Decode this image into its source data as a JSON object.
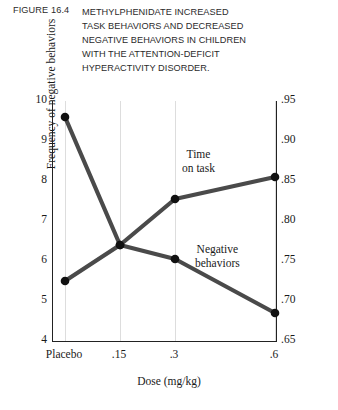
{
  "figure": {
    "number_label": "FIGURE 16.4",
    "title_lines": [
      "METHYLPHENIDATE INCREASED",
      "TASK BEHAVIORS AND DECREASED",
      "NEGATIVE BEHAVIORS IN CHILDREN",
      "WITH THE ATTENTION-DEFICIT",
      "HYPERACTIVITY DISORDER."
    ]
  },
  "chart_data": {
    "type": "line",
    "title": "METHYLPHENIDATE INCREASED TASK BEHAVIORS AND DECREASED NEGATIVE BEHAVIORS IN CHILDREN WITH THE ATTENTION-DEFICIT HYPERACTIVITY DISORDER.",
    "xlabel": "Dose (mg/kg)",
    "ylabel": "Frequency of negative behaviors",
    "ylabel_right": "Proportion on task",
    "categories": [
      "Placebo",
      ".15",
      ".3",
      ".6"
    ],
    "x_positions": [
      0,
      0.15,
      0.3,
      0.6
    ],
    "xticklabels": [
      "Placebo",
      ".15",
      ".3",
      ".6"
    ],
    "ylim": [
      4,
      10
    ],
    "yticks": [
      4,
      5,
      6,
      7,
      8,
      9,
      10
    ],
    "yticklabels": [
      "4",
      "5",
      "6",
      "7",
      "8",
      "9",
      "10"
    ],
    "ylim_right": [
      0.65,
      0.95
    ],
    "yticks_right": [
      0.65,
      0.7,
      0.75,
      0.8,
      0.85,
      0.9,
      0.95
    ],
    "yticklabels_right": [
      ".65",
      ".70",
      ".75",
      ".80",
      ".85",
      ".90",
      ".95"
    ],
    "grid": "vertical",
    "legend": "inline-annotations",
    "series": [
      {
        "name": "Negative behaviors",
        "axis": "left",
        "annotation": "Negative\nbehaviors",
        "values": [
          9.6,
          6.4,
          6.05,
          4.7
        ],
        "color": "#4a4a4a"
      },
      {
        "name": "Time on task",
        "axis": "right",
        "annotation": "Time\non task",
        "values_right": [
          0.725,
          0.78,
          0.825,
          0.85
        ],
        "values_left_scale": [
          5.5,
          6.4,
          7.55,
          8.1
        ],
        "color": "#4a4a4a"
      }
    ],
    "annotations": [
      {
        "text_line1": "Time",
        "text_line2": "on task"
      },
      {
        "text_line1": "Negative",
        "text_line2": "behaviors"
      }
    ]
  },
  "style": {
    "line_color": "#4a4a4a",
    "marker_color": "#111111",
    "axis_color": "#222222",
    "grid_color": "#dddddd"
  }
}
